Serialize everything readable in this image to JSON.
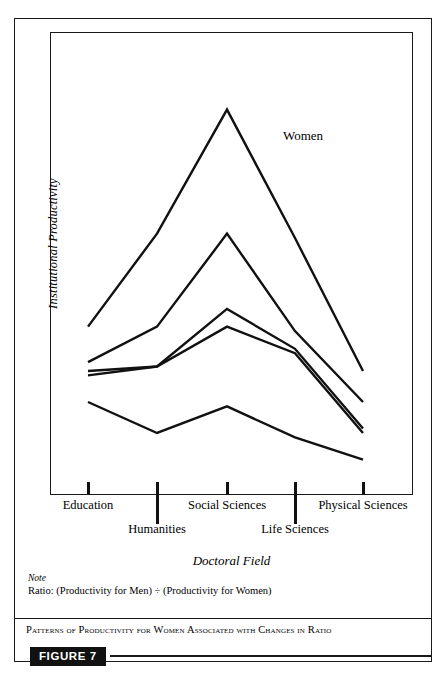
{
  "figure": {
    "badge_label": "FIGURE 7",
    "caption": "Patterns of Productivity for Women Associated with Changes in Ratio",
    "note_title": "Note",
    "note_text": "Ratio: (Productivity for Men) ÷ (Productivity for Women)",
    "annotation_women": "Women"
  },
  "chart_data": {
    "type": "line",
    "title": "Patterns of Productivity for Women Associated with Changes in Ratio",
    "xlabel": "Doctoral Field",
    "ylabel": "Institutional Productivity",
    "grid": false,
    "legend_position": "inline-annotation",
    "annotations": [
      {
        "text": "Women",
        "x": "Life Sciences",
        "y": 82
      }
    ],
    "categories": [
      "Education",
      "Humanities",
      "Social Sciences",
      "Life Sciences",
      "Physical Sciences"
    ],
    "tick_x_px": [
      88,
      157,
      227,
      295,
      363
    ],
    "xlim": [
      0,
      4
    ],
    "ylim": [
      0,
      100
    ],
    "y_axis_ticks_shown": false,
    "series": [
      {
        "name": "line-1",
        "values": [
          38,
          59,
          87,
          58,
          28
        ]
      },
      {
        "name": "line-2",
        "values": [
          30,
          38,
          59,
          37,
          21
        ]
      },
      {
        "name": "line-3",
        "values": [
          28,
          29,
          42,
          33,
          15
        ]
      },
      {
        "name": "line-4",
        "values": [
          27,
          29,
          38,
          32,
          14
        ]
      },
      {
        "name": "line-5",
        "values": [
          21,
          14,
          20,
          13,
          8
        ]
      }
    ]
  },
  "axis": {
    "category_rows": [
      {
        "label": "Education",
        "index": 0,
        "row": "a",
        "tick": "short"
      },
      {
        "label": "Humanities",
        "index": 1,
        "row": "b",
        "tick": "long"
      },
      {
        "label": "Social Sciences",
        "index": 2,
        "row": "a",
        "tick": "short"
      },
      {
        "label": "Life Sciences",
        "index": 3,
        "row": "b",
        "tick": "long"
      },
      {
        "label": "Physical Sciences",
        "index": 4,
        "row": "a",
        "tick": "short"
      }
    ]
  },
  "colors": {
    "ink": "#111111",
    "frame": "#1a1a1a",
    "paper": "#ffffff",
    "badge_bg": "#111111",
    "badge_fg": "#ffffff"
  }
}
